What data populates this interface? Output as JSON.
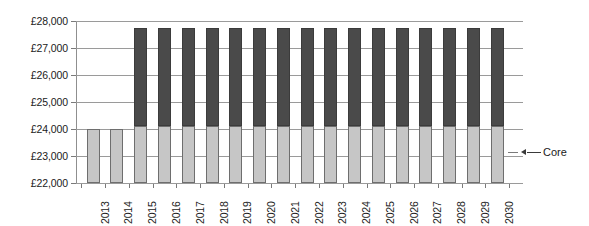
{
  "chart_data": {
    "type": "bar",
    "stacked": true,
    "title": "",
    "xlabel": "",
    "ylabel": "",
    "currency_symbol": "£",
    "categories": [
      "2013",
      "2014",
      "2015",
      "2016",
      "2017",
      "2018",
      "2019",
      "2020",
      "2021",
      "2022",
      "2023",
      "2024",
      "2025",
      "2026",
      "2027",
      "2028",
      "2029",
      "2030"
    ],
    "ytick_labels": [
      "£28,000",
      "£27,000",
      "£26,000",
      "£25,000",
      "£24,000",
      "£23,000",
      "£22,000"
    ],
    "ytick_values": [
      28000,
      27000,
      26000,
      25000,
      24000,
      23000,
      22000
    ],
    "ylim": [
      22000,
      28000
    ],
    "grid": true,
    "legend": "none",
    "series": [
      {
        "name": "Core",
        "color": "#c6c6c6",
        "values": [
          24000,
          24000,
          24100,
          24100,
          24100,
          24100,
          24100,
          24100,
          24100,
          24100,
          24100,
          24100,
          24100,
          24100,
          24100,
          24100,
          24100,
          24100
        ]
      },
      {
        "name": "Upper",
        "color": "#4a4a4a",
        "values": [
          0,
          0,
          3650,
          3650,
          3650,
          3650,
          3650,
          3650,
          3650,
          3650,
          3650,
          3650,
          3650,
          3650,
          3650,
          3650,
          3650,
          3650
        ]
      }
    ],
    "totals": [
      24000,
      24000,
      27750,
      27750,
      27750,
      27750,
      27750,
      27750,
      27750,
      27750,
      27750,
      27750,
      27750,
      27750,
      27750,
      27750,
      27750,
      27750
    ],
    "annotations": [
      {
        "label": "Core",
        "points_to_series": "Core",
        "points_to_category": "2030",
        "arrow": "left"
      }
    ]
  }
}
